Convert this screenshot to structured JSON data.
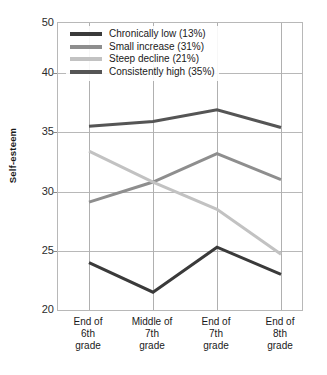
{
  "chart_data": {
    "type": "line",
    "title": "",
    "xlabel": "",
    "ylabel": "Self-esteem",
    "categories": [
      "End of 6th grade",
      "Middle of 7th grade",
      "End of 7th grade",
      "End of 8th grade"
    ],
    "category_lines": [
      [
        "End of",
        "6th",
        "grade"
      ],
      [
        "Middle of",
        "7th",
        "grade"
      ],
      [
        "End of",
        "7th",
        "grade"
      ],
      [
        "End of",
        "8th",
        "grade"
      ]
    ],
    "ylim": [
      20,
      50
    ],
    "yticks": [
      20,
      25,
      30,
      35,
      40,
      50
    ],
    "ytick_labels": [
      "20",
      "25",
      "30",
      "35",
      "40",
      "50"
    ],
    "gridlines_h": [
      25,
      30,
      35,
      40
    ],
    "grid": true,
    "legend_position": "top-left",
    "series": [
      {
        "name": "Chronically low (13%)",
        "color": "#3a3a3a",
        "values": [
          24.0,
          21.5,
          25.3,
          23.0
        ]
      },
      {
        "name": "Small increase (31%)",
        "color": "#8e8e8e",
        "values": [
          29.1,
          30.8,
          33.2,
          31.0
        ]
      },
      {
        "name": "Steep decline (21%)",
        "color": "#c2c2c2",
        "values": [
          33.4,
          30.8,
          28.5,
          24.7
        ]
      },
      {
        "name": "Consistently high (35%)",
        "color": "#555555",
        "values": [
          35.5,
          35.9,
          36.9,
          35.4
        ]
      }
    ]
  },
  "legend": {
    "items": [
      {
        "label": "Chronically low (13%)"
      },
      {
        "label": "Small increase (31%)"
      },
      {
        "label": "Steep decline (21%)"
      },
      {
        "label": "Consistently high (35%)"
      }
    ]
  },
  "axis": {
    "y_title": "Self-esteem"
  }
}
